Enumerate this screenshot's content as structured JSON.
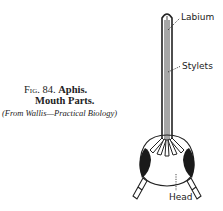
{
  "caption": {
    "figure_number": "Fig. 84.",
    "title_part1": "Aphis.",
    "title_part2": "Mouth Parts.",
    "source": "(From Wallis—Practical Biology)"
  },
  "labels": {
    "labium": "Labium",
    "stylets": "Stylets",
    "head": "Head"
  }
}
